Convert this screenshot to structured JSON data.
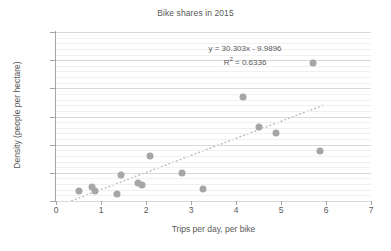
{
  "chart_data": {
    "type": "scatter",
    "title": "Bike shares in 2015",
    "xlabel": "Trips per day, per bike",
    "ylabel": "Density (people per hectare)",
    "xlim": [
      0,
      7
    ],
    "ylim": [
      0,
      300
    ],
    "xticks": [
      "0",
      "1",
      "2",
      "3",
      "4",
      "5",
      "6",
      "7"
    ],
    "yticks": [
      "0",
      "50",
      "100",
      "150",
      "200",
      "250",
      "300"
    ],
    "grid": "horizontal-major-and-minor",
    "legend": "none",
    "marker_color": "#a6a6a6",
    "trendline_color": "#bfbfbf",
    "annotations": {
      "equation": "y = 30.303x - 9.9896",
      "r_squared_prefix": "R",
      "r_squared_exponent": "2",
      "r_squared_value": " = 0.6336"
    },
    "trendline": {
      "style": "dotted",
      "slope": 30.303,
      "intercept": -9.9896,
      "x_start": 0.35,
      "x_end": 5.95
    },
    "points": [
      {
        "x": 0.52,
        "y": 18
      },
      {
        "x": 0.8,
        "y": 25
      },
      {
        "x": 0.86,
        "y": 18
      },
      {
        "x": 1.36,
        "y": 12
      },
      {
        "x": 1.45,
        "y": 46
      },
      {
        "x": 1.82,
        "y": 32
      },
      {
        "x": 1.92,
        "y": 28
      },
      {
        "x": 2.08,
        "y": 79
      },
      {
        "x": 2.8,
        "y": 50
      },
      {
        "x": 3.26,
        "y": 22
      },
      {
        "x": 4.15,
        "y": 185
      },
      {
        "x": 4.52,
        "y": 132
      },
      {
        "x": 4.88,
        "y": 121
      },
      {
        "x": 5.7,
        "y": 245
      },
      {
        "x": 5.87,
        "y": 89
      }
    ]
  }
}
